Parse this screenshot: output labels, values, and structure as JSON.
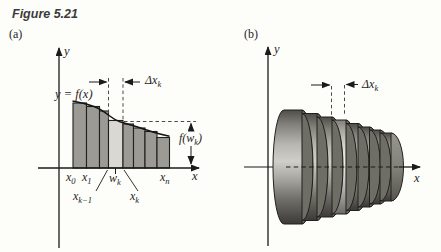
{
  "header": {
    "figure_title": "Figure 5.21",
    "panel_a_tag": "(a)",
    "panel_b_tag": "(b)"
  },
  "colors": {
    "background": "#fdfdfa",
    "outline": "#21201c",
    "curve": "#141414",
    "axis": "#1b1b1b",
    "dash": "#4a4a4a",
    "rect_fill": "#9b9a94",
    "highlight_fill": "#d9d8d2",
    "face": "#6e6d66",
    "disk_light": "#cfcec8",
    "disk_dark": "#4e4d48"
  },
  "panel_a": {
    "axis_labels": {
      "x": "x",
      "y": "y"
    },
    "curve_label": "y = f(x)",
    "delta_label": {
      "pre": "Δx",
      "sub": "k"
    },
    "height_label": {
      "pre": "f(w",
      "sub": "k",
      "post": ")"
    },
    "tick_labels": {
      "x0": {
        "pre": "x",
        "sub": "0"
      },
      "x1": {
        "pre": "x",
        "sub": "1"
      },
      "wk": {
        "pre": "w",
        "sub": "k"
      },
      "xk1": {
        "pre": "x",
        "sub": "k−1"
      },
      "xk": {
        "pre": "x",
        "sub": "k"
      },
      "xn": {
        "pre": "x",
        "sub": "n"
      }
    },
    "geometry": {
      "axis_y": 168,
      "highlight_index": 3,
      "rects": [
        {
          "x": 73,
          "w": 13.5,
          "top": 103
        },
        {
          "x": 86.5,
          "w": 13,
          "top": 106.5
        },
        {
          "x": 99.5,
          "w": 9,
          "top": 111
        },
        {
          "x": 108.5,
          "w": 14.5,
          "top": 120.5
        },
        {
          "x": 123,
          "w": 10.5,
          "top": 124
        },
        {
          "x": 133.5,
          "w": 11.5,
          "top": 128
        },
        {
          "x": 145,
          "w": 12,
          "top": 131.5
        },
        {
          "x": 157,
          "w": 12.5,
          "top": 137.5
        }
      ],
      "curve_path": "M 72.5 101 C 80 102.3 87 104 94 106.5 C 100 108.7 104 111.5 109 115.5 C 113 118.6 116 120.3 120 121.8 C 125 123.5 130 124.6 136 126.5 C 142 128.4 147 130.2 152 131.8 C 158 133.7 164 135.2 169.5 136.3",
      "lines": [
        {
          "x1": 38,
          "y1": 168,
          "x2": 199,
          "y2": 168,
          "me": 1,
          "w": 1.3
        },
        {
          "x1": 59,
          "y1": 248,
          "x2": 59,
          "y2": 48,
          "me": 1,
          "w": 1.3
        },
        {
          "x1": 108.5,
          "y1": 78,
          "x2": 108.5,
          "y2": 119,
          "dash": "3.5 2.8",
          "w": 1,
          "c": "#4a4a4a"
        },
        {
          "x1": 123,
          "y1": 78,
          "x2": 123,
          "y2": 120,
          "dash": "3.5 2.8",
          "w": 1,
          "c": "#4a4a4a"
        },
        {
          "x1": 124,
          "y1": 121.5,
          "x2": 196,
          "y2": 121.5,
          "dash": "3.5 2.8",
          "w": 1,
          "c": "#4a4a4a"
        },
        {
          "x1": 89,
          "y1": 82,
          "x2": 106.5,
          "y2": 82,
          "me": 1,
          "w": 1
        },
        {
          "x1": 140,
          "y1": 82,
          "x2": 125,
          "y2": 82,
          "me": 1,
          "w": 1
        },
        {
          "x1": 191,
          "y1": 130,
          "x2": 191,
          "y2": 123.5,
          "me": 1,
          "w": 1
        },
        {
          "x1": 191,
          "y1": 146,
          "x2": 191,
          "y2": 164,
          "me": 1,
          "w": 1
        },
        {
          "x1": 115.5,
          "y1": 168,
          "x2": 115.5,
          "y2": 174,
          "w": 1
        },
        {
          "x1": 96,
          "y1": 191,
          "x2": 107.5,
          "y2": 170,
          "w": 0.9
        },
        {
          "x1": 138,
          "y1": 191,
          "x2": 124,
          "y2": 170,
          "w": 0.9
        }
      ]
    }
  },
  "panel_b": {
    "axis_labels": {
      "x": "x",
      "y": "y"
    },
    "delta_label": {
      "pre": "Δx",
      "sub": "k"
    },
    "geometry": {
      "cy": 167,
      "rx": 11,
      "highlight_index": 3,
      "disks": [
        {
          "x1": 284,
          "x2": 302,
          "r": 57
        },
        {
          "x1": 302,
          "x2": 317,
          "r": 53.5
        },
        {
          "x1": 317,
          "x2": 332,
          "r": 50
        },
        {
          "x1": 332,
          "x2": 346,
          "r": 47
        },
        {
          "x1": 346,
          "x2": 358,
          "r": 43.5
        },
        {
          "x1": 358,
          "x2": 369.5,
          "r": 40
        },
        {
          "x1": 369.5,
          "x2": 380,
          "r": 37
        },
        {
          "x1": 380,
          "x2": 391,
          "r": 34
        }
      ],
      "lines_under": [
        {
          "x1": 268,
          "y1": 246,
          "x2": 268,
          "y2": 47,
          "me": 1,
          "w": 1.3
        },
        {
          "x1": 244,
          "y1": 167,
          "x2": 286,
          "y2": 167,
          "w": 1.2
        }
      ],
      "lines_over": [
        {
          "x1": 286,
          "y1": 167,
          "x2": 399,
          "y2": 167,
          "dash": "4.5 3.2",
          "w": 1.2
        },
        {
          "x1": 399,
          "y1": 167,
          "x2": 420,
          "y2": 167,
          "me": 1,
          "w": 1.3
        },
        {
          "x1": 331.5,
          "y1": 86,
          "x2": 331.5,
          "y2": 116,
          "dash": "3.5 2.8",
          "w": 1,
          "c": "#4a4a4a"
        },
        {
          "x1": 344.5,
          "y1": 85,
          "x2": 344.5,
          "y2": 114,
          "dash": "3.5 2.8",
          "w": 1,
          "c": "#4a4a4a"
        },
        {
          "x1": 311,
          "y1": 85,
          "x2": 329.5,
          "y2": 85,
          "me": 1,
          "w": 1
        },
        {
          "x1": 358,
          "y1": 84.5,
          "x2": 346.5,
          "y2": 84.5,
          "me": 1,
          "w": 1
        }
      ]
    }
  }
}
